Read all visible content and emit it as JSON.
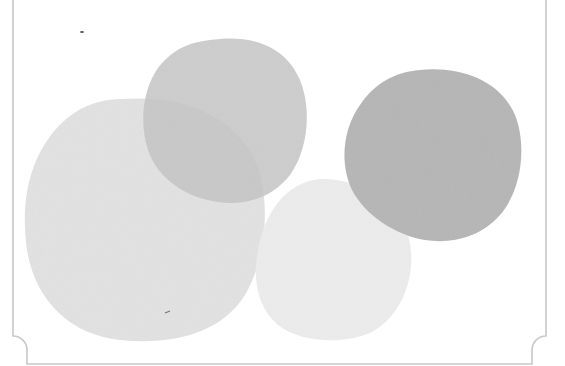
{
  "image": {
    "description": "Watercolor-style overlapping gray circles inside a frame with scalloped bottom corners",
    "frame": {
      "stroke": "#c8c8c8",
      "left": 13,
      "right": 546,
      "bottom": 364,
      "corner_radius": 14
    },
    "circles": [
      {
        "name": "large-left-circle",
        "cx": 145,
        "cy": 220,
        "rx": 120,
        "ry": 122,
        "fill": "#e2e2e2",
        "opacity": 1
      },
      {
        "name": "bottom-middle-circle",
        "cx": 333,
        "cy": 260,
        "rx": 78,
        "ry": 82,
        "fill": "#ececec",
        "opacity": 1
      },
      {
        "name": "top-middle-circle",
        "cx": 225,
        "cy": 121,
        "rx": 83,
        "ry": 83,
        "fill": "#c9c9c9",
        "opacity": 0.85
      },
      {
        "name": "right-circle",
        "cx": 433,
        "cy": 155,
        "rx": 89,
        "ry": 87,
        "fill": "#b6b6b6",
        "opacity": 1
      }
    ],
    "marks": [
      {
        "name": "speck-top-left",
        "x": 82,
        "y": 32
      },
      {
        "name": "speck-bottom-left",
        "x": 168,
        "y": 312
      }
    ]
  }
}
